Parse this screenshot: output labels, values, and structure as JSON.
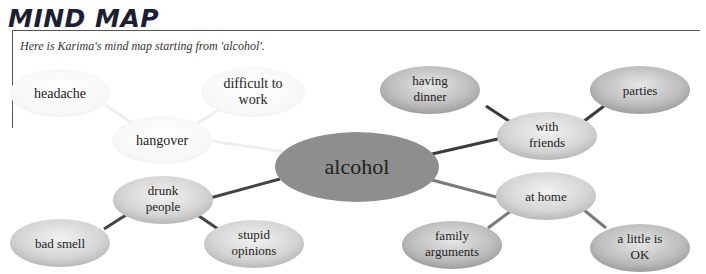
{
  "header": {
    "title": "MIND MAP",
    "subtitle": "Here is Karima's mind map starting from 'alcohol'."
  },
  "mind_map": {
    "center": {
      "id": "alcohol",
      "label": "alcohol"
    },
    "nodes": [
      {
        "id": "hangover",
        "label": "hangover",
        "parent": "alcohol",
        "style": "faded"
      },
      {
        "id": "headache",
        "label": "headache",
        "parent": "hangover",
        "style": "faded"
      },
      {
        "id": "difficult_to_work",
        "label": "difficult to work",
        "parent": "hangover",
        "style": "faded"
      },
      {
        "id": "drunk_people",
        "label": "drunk people",
        "parent": "alcohol",
        "style": "light"
      },
      {
        "id": "bad_smell",
        "label": "bad smell",
        "parent": "drunk_people",
        "style": "light"
      },
      {
        "id": "stupid_opinions",
        "label": "stupid opinions",
        "parent": "drunk_people",
        "style": "light"
      },
      {
        "id": "with_friends",
        "label": "with friends",
        "parent": "alcohol",
        "style": "light"
      },
      {
        "id": "having_dinner",
        "label": "having dinner",
        "parent": "with_friends",
        "style": "medium"
      },
      {
        "id": "parties",
        "label": "parties",
        "parent": "with_friends",
        "style": "medium"
      },
      {
        "id": "at_home",
        "label": "at home",
        "parent": "alcohol",
        "style": "light"
      },
      {
        "id": "family_arguments",
        "label": "family arguments",
        "parent": "at_home",
        "style": "medium"
      },
      {
        "id": "a_little_is_ok",
        "label": "a little is OK",
        "parent": "at_home",
        "style": "medium"
      }
    ],
    "labels": {
      "alcohol": "alcohol",
      "hangover": "hangover",
      "headache": "headache",
      "difficult_to_work_1": "difficult to",
      "difficult_to_work_2": "work",
      "drunk_people_1": "drunk",
      "drunk_people_2": "people",
      "bad_smell": "bad smell",
      "stupid_opinions_1": "stupid",
      "stupid_opinions_2": "opinions",
      "with_friends_1": "with",
      "with_friends_2": "friends",
      "having_dinner_1": "having",
      "having_dinner_2": "dinner",
      "parties": "parties",
      "at_home": "at home",
      "family_arguments_1": "family",
      "family_arguments_2": "arguments",
      "a_little_is_ok_1": "a little is",
      "a_little_is_ok_2": "OK"
    },
    "colors": {
      "center_fill": "#8e8e8e",
      "node_light": "#d6d6d6",
      "node_medium": "#bdbdbd",
      "node_faded": "#f4f4f4",
      "connector_dark": "#3a3a3a",
      "connector_mid": "#7a7a7a",
      "connector_faded": "#eeeeee",
      "title_color": "#1c1f33"
    }
  }
}
